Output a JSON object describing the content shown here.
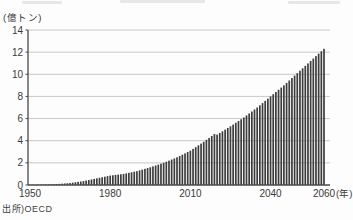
{
  "chart_data": {
    "type": "bar",
    "ylabel": "(億トン)",
    "x_axis_suffix": "(年)",
    "source": "出所)OECD",
    "x_start_year": 1950,
    "x_end_year": 2060,
    "x_tick_years": [
      1950,
      1980,
      2010,
      2040,
      2060
    ],
    "y_ticks": [
      0,
      2,
      4,
      6,
      8,
      10,
      12,
      14
    ],
    "ylim": [
      0,
      14
    ],
    "grid": true,
    "legend": "none",
    "bar_color": "#3d3d3d",
    "grid_color": "#c9c9c9",
    "axis_color": "#4a4a4a",
    "text_color": "#3a3a3a",
    "values": [
      0.02,
      0.024,
      0.028,
      0.032,
      0.036,
      0.04,
      0.048,
      0.056,
      0.064,
      0.072,
      0.08,
      0.1,
      0.12,
      0.14,
      0.16,
      0.18,
      0.214,
      0.248,
      0.282,
      0.316,
      0.35,
      0.4,
      0.45,
      0.5,
      0.55,
      0.6,
      0.65,
      0.7,
      0.75,
      0.8,
      0.85,
      0.88,
      0.91,
      0.94,
      0.97,
      1.0,
      1.05,
      1.1,
      1.15,
      1.2,
      1.25,
      1.32,
      1.39,
      1.46,
      1.53,
      1.6,
      1.68,
      1.76,
      1.84,
      1.92,
      2.0,
      2.1,
      2.2,
      2.3,
      2.4,
      2.5,
      2.62,
      2.74,
      2.86,
      2.98,
      3.1,
      3.26,
      3.42,
      3.58,
      3.74,
      3.9,
      4.08,
      4.25,
      4.43,
      4.6,
      4.55,
      4.7,
      4.85,
      5.0,
      5.15,
      5.3,
      5.46,
      5.62,
      5.78,
      5.94,
      6.1,
      6.28,
      6.46,
      6.64,
      6.82,
      7.0,
      7.2,
      7.4,
      7.6,
      7.8,
      8.0,
      8.2,
      8.4,
      8.6,
      8.8,
      9.0,
      9.22,
      9.44,
      9.66,
      9.88,
      10.1,
      10.32,
      10.54,
      10.76,
      10.98,
      11.2,
      11.42,
      11.64,
      11.86,
      12.08,
      12.3
    ]
  }
}
